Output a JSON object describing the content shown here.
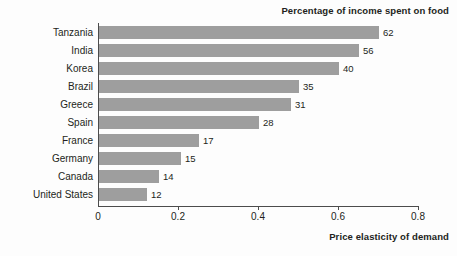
{
  "chart_data": {
    "type": "bar",
    "orientation": "horizontal",
    "title": "Percentage of income spent on food",
    "xlabel": "Price elasticity of demand",
    "ylabel": "",
    "xlim": [
      0,
      0.8
    ],
    "xticks": [
      "0",
      "0.2",
      "0.4",
      "0.6",
      "0.8"
    ],
    "xtick_values": [
      0,
      0.2,
      0.4,
      0.6,
      0.8
    ],
    "grid": false,
    "legend": null,
    "bar_color": "#9e9e9e",
    "axis_color": "#4c4c4c",
    "text_color": "#231f20",
    "categories": [
      "Tanzania",
      "India",
      "Korea",
      "Brazil",
      "Greece",
      "Spain",
      "France",
      "Germany",
      "Canada",
      "United States"
    ],
    "values": [
      0.7,
      0.65,
      0.6,
      0.5,
      0.48,
      0.4,
      0.25,
      0.205,
      0.15,
      0.12
    ],
    "point_labels": [
      "62",
      "56",
      "40",
      "35",
      "31",
      "28",
      "17",
      "15",
      "14",
      "12"
    ],
    "bars": [
      {
        "category": "Tanzania",
        "value": 0.7,
        "label": "62"
      },
      {
        "category": "India",
        "value": 0.65,
        "label": "56"
      },
      {
        "category": "Korea",
        "value": 0.6,
        "label": "40"
      },
      {
        "category": "Brazil",
        "value": 0.5,
        "label": "35"
      },
      {
        "category": "Greece",
        "value": 0.48,
        "label": "31"
      },
      {
        "category": "Spain",
        "value": 0.4,
        "label": "28"
      },
      {
        "category": "France",
        "value": 0.25,
        "label": "17"
      },
      {
        "category": "Germany",
        "value": 0.205,
        "label": "15"
      },
      {
        "category": "Canada",
        "value": 0.15,
        "label": "14"
      },
      {
        "category": "United States",
        "value": 0.12,
        "label": "12"
      }
    ]
  }
}
